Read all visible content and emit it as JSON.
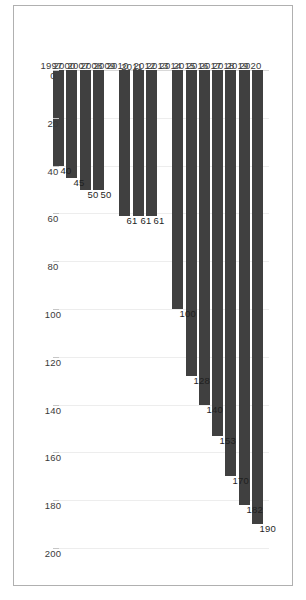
{
  "chart_data": {
    "type": "bar",
    "orientation": "horizontal",
    "title": "",
    "subtitle": "",
    "xlabel": "",
    "ylabel": "",
    "grid": true,
    "legend": false,
    "legend_position": "none",
    "bar_color": "#404040",
    "gridline_color": "#ededed",
    "axis_text_color": "#3a3a3a",
    "data_label_color": "#1f1f1f",
    "frame_color": "#b0b0b0",
    "background": "#ffffff",
    "value_axis": {
      "min": 0,
      "max": 200,
      "step": 20,
      "direction": "increasing-right",
      "ticks": [
        0,
        20,
        40,
        60,
        80,
        100,
        120,
        140,
        160,
        180,
        200
      ],
      "tick_labels": [
        "0",
        "20",
        "40",
        "60",
        "80",
        "100",
        "120",
        "140",
        "160",
        "180",
        "200"
      ]
    },
    "categories": [
      "2020",
      "2019",
      "2018",
      "2017",
      "2016",
      "2015",
      "2014",
      "2013",
      "2012",
      "2011",
      "2010",
      "2009",
      "2008",
      "2007",
      "2000",
      "1997"
    ],
    "values": [
      190,
      182,
      170,
      153,
      140,
      128,
      100,
      null,
      61,
      61,
      61,
      null,
      50,
      50,
      45,
      40
    ],
    "data_labels": [
      "190",
      "182",
      "170",
      "153",
      "140",
      "128",
      "100",
      "",
      "61",
      "61",
      "61",
      "",
      "50",
      "50",
      "45",
      "40"
    ],
    "points": [
      {
        "category": "2020",
        "value": 190,
        "label": "190"
      },
      {
        "category": "2019",
        "value": 182,
        "label": "182"
      },
      {
        "category": "2018",
        "value": 170,
        "label": "170"
      },
      {
        "category": "2017",
        "value": 153,
        "label": "153"
      },
      {
        "category": "2016",
        "value": 140,
        "label": "140"
      },
      {
        "category": "2015",
        "value": 128,
        "label": "128"
      },
      {
        "category": "2014",
        "value": 100,
        "label": "100"
      },
      {
        "category": "2013",
        "value": null,
        "label": ""
      },
      {
        "category": "2012",
        "value": 61,
        "label": "61"
      },
      {
        "category": "2011",
        "value": 61,
        "label": "61"
      },
      {
        "category": "2010",
        "value": 61,
        "label": "61"
      },
      {
        "category": "2009",
        "value": null,
        "label": ""
      },
      {
        "category": "2008",
        "value": 50,
        "label": "50"
      },
      {
        "category": "2007",
        "value": 50,
        "label": "50"
      },
      {
        "category": "2000",
        "value": 45,
        "label": "45"
      },
      {
        "category": "1997",
        "value": 40,
        "label": "40"
      }
    ]
  }
}
